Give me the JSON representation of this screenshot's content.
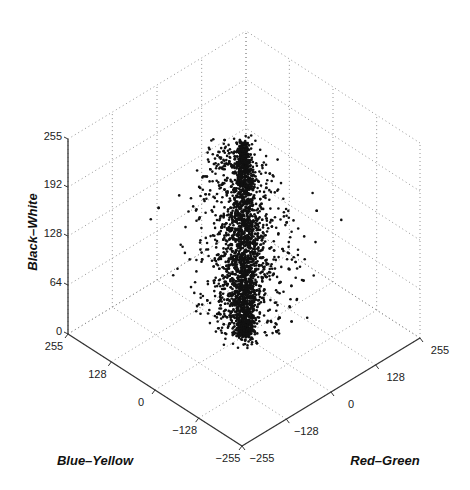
{
  "chart_data": {
    "type": "scatter",
    "dimensions": 3,
    "title": "",
    "axes": {
      "x": {
        "label": "Red–Green",
        "range": [
          -255,
          255
        ],
        "ticks": [
          -255,
          -128,
          0,
          128,
          255
        ],
        "tick_labels": [
          "−255",
          "−128",
          "0",
          "128",
          "255"
        ]
      },
      "y": {
        "label": "Blue–Yellow",
        "range": [
          -255,
          255
        ],
        "ticks": [
          255,
          128,
          0,
          -128,
          -255
        ],
        "tick_labels": [
          "255",
          "128",
          "0",
          "−128",
          "−255"
        ]
      },
      "z": {
        "label": "Black–White",
        "range": [
          0,
          255
        ],
        "ticks": [
          0,
          64,
          128,
          192,
          255
        ],
        "tick_labels": [
          "0",
          "64",
          "128",
          "192",
          "255"
        ]
      }
    },
    "grid": true,
    "legend": null,
    "marker": {
      "color": "#111111",
      "size": 2.2
    },
    "distribution": {
      "description": "Dense vertical column of ~3000 points centered near Red–Green≈0, Blue–Yellow≈0, spanning Black–White 0–255; spread widens toward mid/upper luminance and toward negative Red–Green side at top",
      "n_points": 3000,
      "center_rg": 0,
      "center_by": 0,
      "core_spread_rg": 12,
      "core_spread_by": 12,
      "halo_spread_rg": 40,
      "halo_spread_by": 40,
      "halo_fraction": 0.35,
      "bw_range": [
        0,
        252
      ]
    }
  },
  "labels": {
    "z_axis": "Black–White",
    "y_axis": "Blue–Yellow",
    "x_axis": "Red–Green"
  }
}
